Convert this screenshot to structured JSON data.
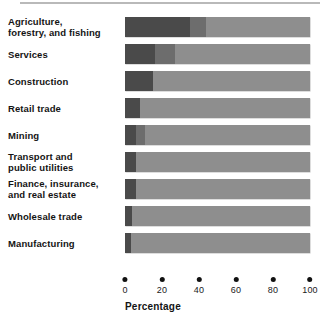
{
  "chart_data": {
    "type": "bar",
    "orientation": "horizontal",
    "stacked": true,
    "title": "",
    "xlabel": "Percentage",
    "ylabel": "",
    "xlim": [
      0,
      100
    ],
    "xticks": [
      0,
      20,
      40,
      60,
      80,
      100
    ],
    "xtick_labels": [
      "0",
      "20",
      "40",
      "60",
      "80",
      "100"
    ],
    "grid": false,
    "legend": "none",
    "categories": [
      "Agriculture, forestry, and fishing",
      "Services",
      "Construction",
      "Retail trade",
      "Mining",
      "Transport and public utilities",
      "Finance, insurance, and real estate",
      "Wholesale trade",
      "Manufacturing"
    ],
    "series": [
      {
        "name": "segment-1",
        "color": "#4a4a4a",
        "values": [
          35,
          16,
          15,
          8,
          6,
          6,
          6,
          4,
          3
        ]
      },
      {
        "name": "segment-2",
        "color": "#6d6d6d",
        "values": [
          9,
          11,
          0,
          0,
          5,
          0,
          0,
          0,
          0
        ]
      },
      {
        "name": "segment-3",
        "color": "#8e8e8e",
        "values": [
          56,
          73,
          85,
          92,
          89,
          94,
          94,
          96,
          97
        ]
      }
    ]
  },
  "labels": {
    "rows": [
      {
        "lines": [
          "Agriculture,",
          "forestry, and fishing"
        ]
      },
      {
        "lines": [
          "Services"
        ]
      },
      {
        "lines": [
          "Construction"
        ]
      },
      {
        "lines": [
          "Retail trade"
        ]
      },
      {
        "lines": [
          "Mining"
        ]
      },
      {
        "lines": [
          "Transport and",
          "public utilities"
        ]
      },
      {
        "lines": [
          "Finance, insurance,",
          "and real estate"
        ]
      },
      {
        "lines": [
          "Wholesale trade"
        ]
      },
      {
        "lines": [
          "Manufacturing"
        ]
      }
    ]
  },
  "axis": {
    "title": "Percentage",
    "ticks": [
      "0",
      "20",
      "40",
      "60",
      "80",
      "100"
    ]
  },
  "colors": {
    "segment_dark": "#4a4a4a",
    "segment_medium": "#6d6d6d",
    "segment_light": "#8e8e8e",
    "text": "#141414",
    "background": "#ffffff"
  }
}
